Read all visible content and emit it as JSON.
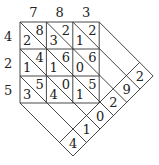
{
  "top_digits": [
    "7",
    "8",
    "3"
  ],
  "left_digits": [
    "4",
    "2",
    "5"
  ],
  "cells": [
    [
      {
        "tens": "2",
        "ones": "8"
      },
      {
        "tens": "3",
        "ones": "2"
      },
      {
        "tens": "1",
        "ones": "2"
      }
    ],
    [
      {
        "tens": "1",
        "ones": "4"
      },
      {
        "tens": "1",
        "ones": "6"
      },
      {
        "tens": "0",
        "ones": "6"
      }
    ],
    [
      {
        "tens": "3",
        "ones": "5"
      },
      {
        "tens": "4",
        "ones": "0"
      },
      {
        "tens": "1",
        "ones": "5"
      }
    ]
  ],
  "result_digits": [
    "4",
    "1",
    "0",
    "2",
    "9",
    "2"
  ],
  "colors": {
    "line": "#333333",
    "text": "#222222",
    "background": "#ffffff"
  }
}
